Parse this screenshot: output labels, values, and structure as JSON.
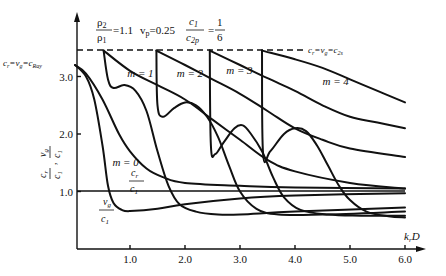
{
  "chart_data": {
    "type": "line",
    "title": "",
    "annotation_params": {
      "rho_ratio_label": "ρ2/ρ1",
      "rho_ratio_value": "=1.1",
      "poisson_label": "vp",
      "poisson_value": "=0.25",
      "speed_ratio_label": "c1/c2p",
      "speed_ratio_value": "= 1/6"
    },
    "xlabel": "k_r D",
    "ylabel": "c_r/c_1 , v_g/c_1",
    "xlim": [
      0,
      6.3
    ],
    "ylim": [
      0,
      3.9
    ],
    "x_ticks": [
      1.0,
      2.0,
      3.0,
      4.0,
      5.0,
      6.0
    ],
    "x_tick_labels": [
      "1.0",
      "2.0",
      "3.0",
      "4.0",
      "5.0",
      "6.0"
    ],
    "y_ticks": [
      1.0,
      2.0,
      3.0
    ],
    "y_tick_labels": [
      "1.0",
      "2.0",
      "3.0"
    ],
    "reference_lines": [
      {
        "name": "c_r = v_g = c_2s",
        "y": 3.45,
        "style": "dashed"
      },
      {
        "name": "unity",
        "y": 1.0,
        "style": "solid"
      }
    ],
    "left_annotation": "c_r = v_g = c_Ray",
    "right_annotation": "c_r = v_g = c_2s",
    "series": [
      {
        "name": "m=0 c_r/c1",
        "mode": 0,
        "kind": "phase",
        "x": [
          0,
          0.2,
          0.5,
          0.8,
          1.0,
          1.3,
          1.6,
          2.0,
          3.0,
          4.0,
          6.0
        ],
        "y": [
          3.2,
          3.05,
          2.6,
          2.0,
          1.7,
          1.4,
          1.25,
          1.15,
          1.1,
          1.07,
          1.05
        ]
      },
      {
        "name": "m=0 v_g/c1",
        "mode": 0,
        "kind": "group",
        "x": [
          0,
          0.2,
          0.35,
          0.5,
          0.6,
          0.7,
          0.85,
          1.0,
          1.5,
          2.0,
          3.0,
          4.0,
          6.0
        ],
        "y": [
          3.2,
          3.0,
          2.6,
          1.8,
          1.1,
          0.8,
          0.68,
          0.66,
          0.7,
          0.78,
          0.88,
          0.93,
          0.97
        ]
      },
      {
        "name": "m=1 c_r/c1",
        "mode": 1,
        "kind": "phase",
        "x": [
          0.52,
          1.0,
          1.5,
          2.0,
          2.5,
          3.0,
          3.5,
          4.0,
          5.0,
          6.0
        ],
        "y": [
          3.45,
          3.1,
          2.85,
          2.6,
          2.25,
          1.9,
          1.55,
          1.35,
          1.15,
          1.05
        ]
      },
      {
        "name": "m=1 v_g/c1",
        "mode": 1,
        "kind": "group",
        "x": [
          0.52,
          0.6,
          0.7,
          0.9,
          1.1,
          1.3,
          1.5,
          1.7,
          1.9,
          2.2,
          2.6,
          3.0,
          4.0,
          6.0
        ],
        "y": [
          3.45,
          2.95,
          2.8,
          2.85,
          2.75,
          2.4,
          1.7,
          1.1,
          0.78,
          0.65,
          0.6,
          0.6,
          0.65,
          0.72
        ]
      },
      {
        "name": "m=2 c_r/c1",
        "mode": 2,
        "kind": "phase",
        "x": [
          1.48,
          2.0,
          2.5,
          3.0,
          3.5,
          4.0,
          4.5,
          5.0,
          6.0
        ],
        "y": [
          3.45,
          3.2,
          2.95,
          2.7,
          2.4,
          2.1,
          1.9,
          1.75,
          1.6
        ]
      },
      {
        "name": "m=2 v_g/c1",
        "mode": 2,
        "kind": "group",
        "x": [
          1.48,
          1.5,
          1.6,
          1.8,
          2.0,
          2.2,
          2.4,
          2.6,
          2.8,
          3.0,
          3.3,
          3.7,
          4.5,
          6.0
        ],
        "y": [
          3.45,
          2.5,
          2.3,
          2.45,
          2.55,
          2.5,
          2.3,
          1.95,
          1.45,
          1.0,
          0.7,
          0.6,
          0.6,
          0.65
        ]
      },
      {
        "name": "m=3 c_r/c1",
        "mode": 3,
        "kind": "phase",
        "x": [
          2.45,
          3.0,
          3.5,
          4.0,
          4.5,
          5.0,
          5.5,
          6.0
        ],
        "y": [
          3.45,
          3.2,
          2.97,
          2.75,
          2.5,
          2.3,
          2.2,
          2.1
        ]
      },
      {
        "name": "m=3 v_g/c1",
        "mode": 3,
        "kind": "group",
        "x": [
          2.45,
          2.47,
          2.55,
          2.7,
          2.9,
          3.05,
          3.2,
          3.4,
          3.6,
          3.8,
          4.1,
          4.6,
          5.2,
          6.0
        ],
        "y": [
          3.45,
          1.8,
          1.65,
          1.85,
          2.1,
          2.15,
          2.0,
          1.7,
          1.25,
          0.9,
          0.68,
          0.6,
          0.58,
          0.58
        ]
      },
      {
        "name": "m=4 c_r/c1",
        "mode": 4,
        "kind": "phase",
        "x": [
          3.4,
          4.0,
          4.5,
          5.0,
          5.5,
          6.0
        ],
        "y": [
          3.45,
          3.3,
          3.15,
          2.95,
          2.75,
          2.55
        ]
      },
      {
        "name": "m=4 v_g/c1",
        "mode": 4,
        "kind": "group",
        "x": [
          3.4,
          3.42,
          3.55,
          3.8,
          4.0,
          4.2,
          4.4,
          4.6,
          4.8,
          5.0,
          5.3,
          5.7,
          6.0
        ],
        "y": [
          3.45,
          1.65,
          1.7,
          2.0,
          2.1,
          2.05,
          1.8,
          1.45,
          1.1,
          0.85,
          0.65,
          0.57,
          0.55
        ]
      }
    ],
    "mode_labels": [
      {
        "text": "m = 0",
        "x": 0.68,
        "y": 1.45
      },
      {
        "text": "m = 1",
        "x": 0.95,
        "y": 3.0
      },
      {
        "text": "m = 2",
        "x": 1.85,
        "y": 3.0
      },
      {
        "text": "m = 3",
        "x": 2.75,
        "y": 3.05
      },
      {
        "text": "m = 4",
        "x": 4.5,
        "y": 2.85
      }
    ],
    "curve_labels": [
      {
        "text": "c_r / c_1",
        "x": 0.9,
        "y": 1.25
      },
      {
        "text": "v_g / c_1",
        "x": 0.45,
        "y": 0.65
      }
    ]
  },
  "labels": {
    "y_axis_top": "c",
    "y_axis_top_sub": "r",
    "y_axis_bottom": "c",
    "y_axis_bottom_sub": "1",
    "y_axis_vg": "v",
    "y_axis_vg_sub": "g",
    "left_ann_main": "c",
    "left_ann_r": "r",
    "left_ann_eq1": "=v",
    "left_ann_g": "g",
    "left_ann_eq2": "=c",
    "left_ann_ray": "Ray",
    "right_ann_main": "c",
    "right_ann_r": "r",
    "right_ann_eq1": "=v",
    "right_ann_g": "g",
    "right_ann_eq2": "=c",
    "right_ann_2s": "2s",
    "x_axis_k": "k",
    "x_axis_r": "r",
    "x_axis_D": "D",
    "param_rho_num": "ρ",
    "param_rho_num_sub": "2",
    "param_rho_den": "ρ",
    "param_rho_den_sub": "1",
    "param_rho_val": "=1.1",
    "param_nu": "v",
    "param_nu_sub": "p",
    "param_nu_val": "=0.25",
    "param_c_num": "c",
    "param_c_num_sub": "1",
    "param_c_den": "c",
    "param_c_den_sub": "2p",
    "param_eq": "=",
    "param_frac_num": "1",
    "param_frac_den": "6",
    "cr_label_num": "c",
    "cr_label_num_sub": "r",
    "cr_label_den": "c",
    "cr_label_den_sub": "1",
    "vg_label_num": "v",
    "vg_label_num_sub": "g",
    "vg_label_den": "c",
    "vg_label_den_sub": "1"
  }
}
